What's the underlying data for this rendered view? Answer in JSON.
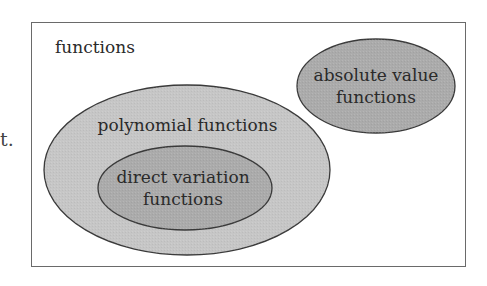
{
  "diagram": {
    "type": "venn",
    "stray_text": "t.",
    "universe": {
      "label": "functions"
    },
    "sets": [
      {
        "id": "polynomial",
        "label": "polynomial functions",
        "fill": "#c4c4c4",
        "contains": [
          "direct_variation"
        ]
      },
      {
        "id": "direct_variation",
        "label_line1": "direct variation",
        "label_line2": "functions",
        "fill": "#a9a9a9",
        "parent": "polynomial"
      },
      {
        "id": "absolute_value",
        "label_line1": "absolute value",
        "label_line2": "functions",
        "fill": "#a9a9a9",
        "overlaps": []
      }
    ],
    "colors": {
      "border": "#6a6a6a",
      "outline": "#3a3a3a",
      "background": "#ffffff"
    }
  }
}
